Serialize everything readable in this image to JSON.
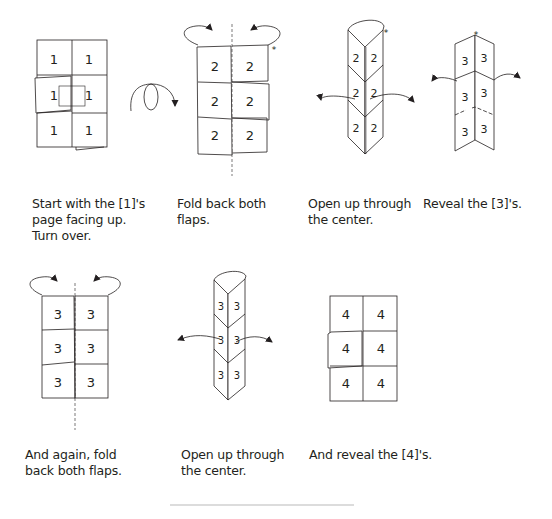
{
  "diagram": {
    "type": "folding-instructions",
    "stroke_color": "#231f20",
    "steps": [
      {
        "id": 1,
        "panel_label": "1",
        "caption": "Start with the [1]'s\npage facing up.\nTurn over.",
        "graphic": "flat-sheet-2x3",
        "extra": "turn-over-arrow"
      },
      {
        "id": 2,
        "panel_label": "2",
        "caption": "Fold back both\nflaps.",
        "graphic": "flat-sheet-2x3-with-fold-back-arrows",
        "marker": "*"
      },
      {
        "id": 3,
        "panel_label": "2",
        "caption": "Open up through\nthe center.",
        "graphic": "triangular-column-open-arrows",
        "marker": "*"
      },
      {
        "id": 4,
        "panel_label": "3",
        "caption": "Reveal the [3]'s.",
        "graphic": "v-fold-opening",
        "marker": "*"
      },
      {
        "id": 5,
        "panel_label": "3",
        "caption": "And again, fold\nback both flaps.",
        "graphic": "flat-sheet-2x3-with-fold-back-arrows"
      },
      {
        "id": 6,
        "panel_label": "3",
        "caption": "Open up through\nthe center.",
        "graphic": "triangular-column-open-arrows"
      },
      {
        "id": 7,
        "panel_label": "4",
        "caption": "And reveal the [4]'s.",
        "graphic": "flat-sheet-2x3"
      }
    ]
  }
}
